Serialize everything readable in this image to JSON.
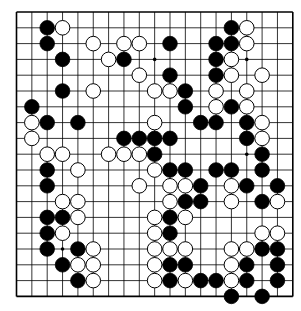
{
  "board": {
    "size": 19,
    "origin_x": 16.5,
    "origin_y": 12,
    "spacing_x": 15.35,
    "spacing_y": 15.8,
    "stone_radius": 7.3,
    "line_color": "#000000",
    "background": "#ffffff",
    "star_points": [
      [
        3,
        3
      ],
      [
        9,
        3
      ],
      [
        15,
        3
      ],
      [
        3,
        9
      ],
      [
        9,
        9
      ],
      [
        15,
        9
      ],
      [
        3,
        15
      ],
      [
        9,
        15
      ],
      [
        15,
        15
      ]
    ],
    "black_stones": [
      [
        2,
        1
      ],
      [
        14,
        1
      ],
      [
        2,
        2
      ],
      [
        10,
        2
      ],
      [
        13,
        2
      ],
      [
        14,
        2
      ],
      [
        3,
        3
      ],
      [
        7,
        3
      ],
      [
        13,
        3
      ],
      [
        10,
        4
      ],
      [
        13,
        4
      ],
      [
        3,
        5
      ],
      [
        11,
        5
      ],
      [
        1,
        6
      ],
      [
        11,
        6
      ],
      [
        14,
        6
      ],
      [
        2,
        7
      ],
      [
        4,
        7
      ],
      [
        12,
        7
      ],
      [
        13,
        7
      ],
      [
        15,
        7
      ],
      [
        7,
        8
      ],
      [
        8,
        8
      ],
      [
        9,
        8
      ],
      [
        10,
        8
      ],
      [
        15,
        8
      ],
      [
        9,
        9
      ],
      [
        16,
        9
      ],
      [
        2,
        10
      ],
      [
        10,
        10
      ],
      [
        11,
        10
      ],
      [
        13,
        10
      ],
      [
        14,
        10
      ],
      [
        16,
        10
      ],
      [
        2,
        11
      ],
      [
        12,
        11
      ],
      [
        15,
        11
      ],
      [
        17,
        11
      ],
      [
        11,
        12
      ],
      [
        12,
        12
      ],
      [
        16,
        12
      ],
      [
        2,
        13
      ],
      [
        3,
        13
      ],
      [
        10,
        13
      ],
      [
        2,
        14
      ],
      [
        10,
        14
      ],
      [
        2,
        15
      ],
      [
        4,
        15
      ],
      [
        16,
        15
      ],
      [
        17,
        15
      ],
      [
        3,
        16
      ],
      [
        10,
        16
      ],
      [
        11,
        16
      ],
      [
        15,
        16
      ],
      [
        17,
        16
      ],
      [
        4,
        17
      ],
      [
        10,
        17
      ],
      [
        12,
        17
      ],
      [
        13,
        17
      ],
      [
        15,
        17
      ],
      [
        17,
        17
      ],
      [
        14,
        18
      ],
      [
        16,
        18
      ]
    ],
    "white_stones": [
      [
        3,
        1
      ],
      [
        15,
        1
      ],
      [
        5,
        2
      ],
      [
        7,
        2
      ],
      [
        8,
        2
      ],
      [
        15,
        2
      ],
      [
        6,
        3
      ],
      [
        14,
        3
      ],
      [
        8,
        4
      ],
      [
        14,
        4
      ],
      [
        16,
        4
      ],
      [
        5,
        5
      ],
      [
        9,
        5
      ],
      [
        10,
        5
      ],
      [
        13,
        5
      ],
      [
        15,
        5
      ],
      [
        13,
        6
      ],
      [
        15,
        6
      ],
      [
        1,
        7
      ],
      [
        9,
        7
      ],
      [
        16,
        7
      ],
      [
        1,
        8
      ],
      [
        16,
        8
      ],
      [
        2,
        9
      ],
      [
        3,
        9
      ],
      [
        6,
        9
      ],
      [
        7,
        9
      ],
      [
        8,
        9
      ],
      [
        4,
        10
      ],
      [
        9,
        10
      ],
      [
        8,
        11
      ],
      [
        10,
        11
      ],
      [
        11,
        11
      ],
      [
        14,
        11
      ],
      [
        3,
        12
      ],
      [
        4,
        12
      ],
      [
        10,
        12
      ],
      [
        14,
        12
      ],
      [
        17,
        12
      ],
      [
        4,
        13
      ],
      [
        9,
        13
      ],
      [
        11,
        13
      ],
      [
        3,
        14
      ],
      [
        9,
        14
      ],
      [
        16,
        14
      ],
      [
        17,
        14
      ],
      [
        5,
        15
      ],
      [
        9,
        15
      ],
      [
        10,
        15
      ],
      [
        11,
        15
      ],
      [
        14,
        15
      ],
      [
        15,
        15
      ],
      [
        4,
        16
      ],
      [
        5,
        16
      ],
      [
        9,
        16
      ],
      [
        14,
        16
      ],
      [
        5,
        17
      ],
      [
        9,
        17
      ],
      [
        11,
        17
      ],
      [
        14,
        17
      ]
    ]
  }
}
